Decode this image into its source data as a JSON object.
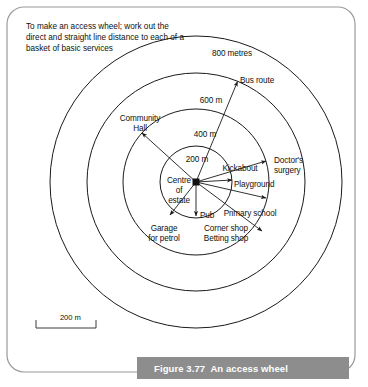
{
  "figure": {
    "caption": "Figure 3.77  An access wheel",
    "intro_note": "To make an access wheel; work out the direct and straight line distance to each of a basket of basic services",
    "centre_label_line1": "Centre",
    "centre_label_line2": "of",
    "centre_label_line3": "estate",
    "scale_bar_label": "200 m"
  },
  "rings": [
    {
      "label": "200 m",
      "radius_m": 200,
      "px_radius": 36
    },
    {
      "label": "400 m",
      "radius_m": 400,
      "px_radius": 73
    },
    {
      "label": "600 m",
      "radius_m": 600,
      "px_radius": 109
    },
    {
      "label": "800 metres",
      "radius_m": 800,
      "px_radius": 146
    }
  ],
  "services": [
    {
      "name": "Bus route",
      "distance_m": 600,
      "bearing_deg": 22
    },
    {
      "name": "Community Hall",
      "label_line1": "Community",
      "label_line2": "Hall",
      "distance_m": 400,
      "bearing_deg": 310
    },
    {
      "name": "Kickabout",
      "distance_m": 400,
      "bearing_deg": 73
    },
    {
      "name": "Doctor's surgery",
      "label_line1": "Doctor's",
      "label_line2": "surgery",
      "distance_m": 400,
      "bearing_deg": 80
    },
    {
      "name": "Playground",
      "distance_m": 300,
      "bearing_deg": 90
    },
    {
      "name": "Primary school",
      "distance_m": 500,
      "bearing_deg": 123
    },
    {
      "name": "Pub",
      "distance_m": 200,
      "bearing_deg": 180
    },
    {
      "name": "Corner shop",
      "distance_m": 200,
      "bearing_deg": 180
    },
    {
      "name": "Betting shop",
      "distance_m": 200,
      "bearing_deg": 180
    },
    {
      "name": "Garage for petrol",
      "label_line1": "Garage",
      "label_line2": "for petrol",
      "distance_m": 250,
      "bearing_deg": 215
    }
  ],
  "labels": {
    "ring_200": "200 m",
    "ring_400": "400 m",
    "ring_600": "600 m",
    "ring_800": "800 metres",
    "bus_route": "Bus route",
    "community_hall_1": "Community",
    "community_hall_2": "Hall",
    "kickabout": "Kickabout",
    "doctors_1": "Doctor's",
    "doctors_2": "surgery",
    "playground": "Playground",
    "primary_school": "Primary school",
    "pub": "Pub",
    "corner_shop": "Corner shop",
    "betting_shop": "Betting shop",
    "garage_1": "Garage",
    "garage_2": "for petrol"
  },
  "colors": {
    "stroke": "#1a1a1a",
    "caption_bg": "#8d8d8d",
    "caption_fg": "#ffffff",
    "frame": "#9a9a9a"
  }
}
